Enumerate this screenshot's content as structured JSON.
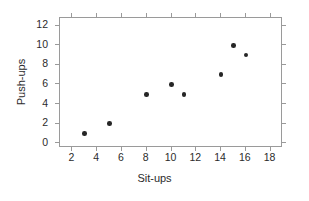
{
  "chart_data": {
    "type": "scatter",
    "title": "",
    "xlabel": "Sit-ups",
    "ylabel": "Push-ups",
    "xlim": [
      1,
      19
    ],
    "ylim": [
      -0.5,
      12.8
    ],
    "xticks": [
      2,
      4,
      6,
      8,
      10,
      12,
      14,
      16,
      18
    ],
    "yticks": [
      0,
      2,
      4,
      6,
      8,
      10,
      12
    ],
    "grid": false,
    "legend": null,
    "marker": {
      "shape": "circle",
      "filled": true,
      "color": "#262626",
      "size_px": 4.6
    },
    "frame_color": "#9a9a9a",
    "background": "#ffffff",
    "points": [
      {
        "x": 3,
        "y": 1
      },
      {
        "x": 5,
        "y": 2
      },
      {
        "x": 8,
        "y": 5
      },
      {
        "x": 10,
        "y": 6
      },
      {
        "x": 11,
        "y": 5
      },
      {
        "x": 14,
        "y": 7
      },
      {
        "x": 15,
        "y": 10
      },
      {
        "x": 16,
        "y": 9
      }
    ]
  }
}
